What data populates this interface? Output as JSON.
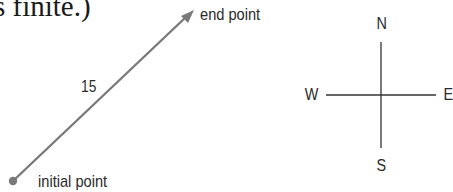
{
  "header_fragment": {
    "text": "s finite.)"
  },
  "vector": {
    "magnitude_label": "15",
    "initial_label": "initial point",
    "end_label": "end point",
    "color": "#7a7a7a",
    "start": [
      13,
      181
    ],
    "end": [
      193,
      11
    ]
  },
  "compass": {
    "north": "N",
    "south": "S",
    "west": "W",
    "east": "E",
    "center": [
      381,
      95
    ],
    "color": "#333333"
  }
}
